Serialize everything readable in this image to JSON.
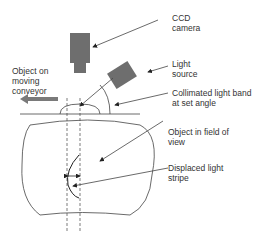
{
  "diagram": {
    "labels": {
      "camera": [
        "CCD",
        "camera"
      ],
      "light": [
        "Light",
        "source"
      ],
      "object": [
        "Object on",
        "moving",
        "conveyor"
      ],
      "band": [
        "Collimated light band",
        "at set angle"
      ],
      "fov": [
        "Object in field of",
        "view"
      ],
      "stripe": [
        "Displaced light",
        "stripe"
      ]
    },
    "colors": {
      "device": "#6e6e6e",
      "line": "#444444",
      "arrow": "#7a7a7a"
    }
  }
}
